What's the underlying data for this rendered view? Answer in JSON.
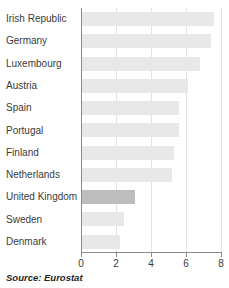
{
  "chart_data": {
    "type": "bar",
    "orientation": "horizontal",
    "title": "",
    "xlabel": "",
    "ylabel": "",
    "xlim": [
      0,
      8
    ],
    "xticks": [
      0,
      2,
      4,
      6,
      8
    ],
    "xtick_labels": [
      "0",
      "2",
      "4",
      "6",
      "8"
    ],
    "grid": true,
    "grid_axis": "x",
    "legend": false,
    "categories": [
      "Irish Republic",
      "Germany",
      "Luxembourg",
      "Austria",
      "Spain",
      "Portugal",
      "Finland",
      "Netherlands",
      "United Kingdom",
      "Sweden",
      "Denmark"
    ],
    "values": [
      7.6,
      7.4,
      6.8,
      6.1,
      5.6,
      5.6,
      5.3,
      5.2,
      3.1,
      2.45,
      2.2
    ],
    "highlight_category": "United Kingdom",
    "colors": {
      "bar": "#e8e8e8",
      "bar_highlight": "#bdbdbd",
      "axis": "#8c8c8c",
      "grid": "#e3e3e3",
      "text": "#3b3b3b"
    }
  },
  "footer": {
    "source": "Source: Eurostat"
  }
}
